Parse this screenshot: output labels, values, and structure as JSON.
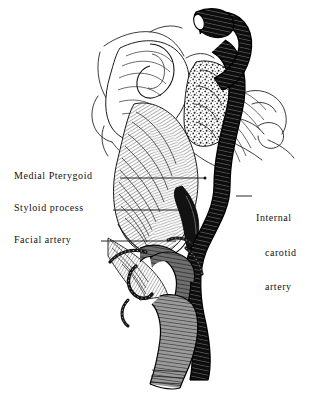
{
  "figure": {
    "style": "black-and-white engraved line drawing",
    "background_color": "#ffffff",
    "ink_color": "#111111"
  },
  "labels": {
    "medial_pterygoid": "Medial Pterygoid",
    "styloid_process": "Styloid process",
    "facial_artery": "Facial artery",
    "internal_carotid": {
      "line1": "Internal",
      "line2": "carotid",
      "line3": "artery"
    }
  },
  "leaders": [
    {
      "name": "leader-medial-pterygoid",
      "x1": 120,
      "y1": 178,
      "x2": 205,
      "y2": 178
    },
    {
      "name": "leader-styloid-process",
      "x1": 113,
      "y1": 210,
      "x2": 196,
      "y2": 210
    },
    {
      "name": "leader-facial-artery",
      "x1": 101,
      "y1": 241,
      "x2": 176,
      "y2": 241
    },
    {
      "name": "leader-internal-carotid",
      "x1": 252,
      "y1": 196,
      "x2": 236,
      "y2": 196
    }
  ],
  "structures": [
    {
      "name": "internal-carotid-artery",
      "tone": "dark",
      "texture": "ribbed-tube"
    },
    {
      "name": "facial-artery",
      "tone": "mid-gray",
      "texture": "ribbed-tube"
    },
    {
      "name": "medial-pterygoid-muscle",
      "tone": "light",
      "texture": "fine-diagonal-hatching"
    },
    {
      "name": "styloid-process",
      "tone": "dark",
      "texture": "solid-spine"
    },
    {
      "name": "cancellous-bone",
      "tone": "stipple",
      "texture": "trabecular-stipple"
    },
    {
      "name": "skull-base-outline",
      "tone": "outline",
      "texture": "contour-lines"
    }
  ]
}
